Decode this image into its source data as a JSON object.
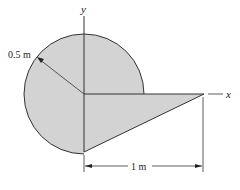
{
  "figure": {
    "labels": {
      "y_axis": "y",
      "x_axis": "x",
      "radius": "0.5 m",
      "length": "1 m"
    },
    "caption": "",
    "colors": {
      "fill": "#d3d3d3",
      "stroke": "#333333",
      "background": "#ffffff"
    },
    "geometry": {
      "circle_radius_m": 0.5,
      "circle_portion": "three-quarter circle (quadrant I removed, replaced by triangle below x-axis)",
      "triangle_base_m": 1.0,
      "triangle_height_m": 0.5
    }
  }
}
